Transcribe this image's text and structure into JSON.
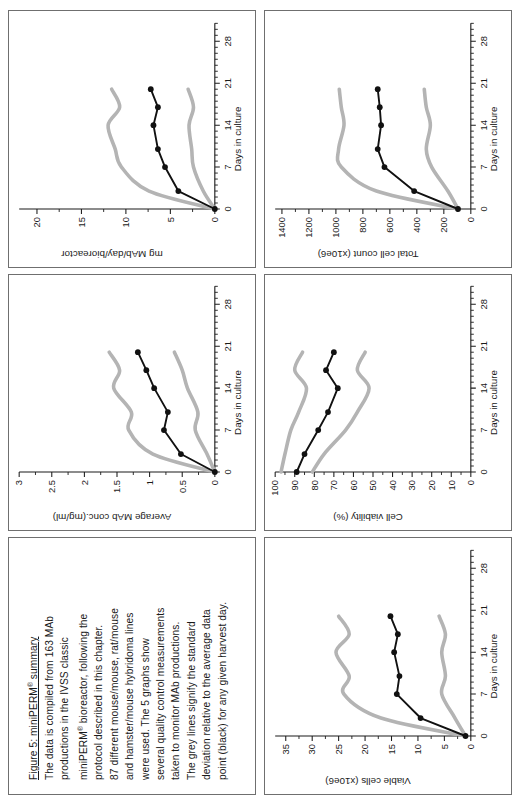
{
  "figure": {
    "caption_title": "Figure 5: miniPERM® summary",
    "caption_lines": [
      "The data is compiled from 163 MAb",
      "productions in the IVSS classic",
      "miniPERM®  bioreactor, following the",
      "protocol described in this chapter.",
      "87 different mouse/mouse, rat/mouse",
      "and hamster/mouse hybridoma lines",
      "were used. The 5 graphs show",
      "several quality control measurements",
      "taken to monitor MAb productions.",
      "The grey lines signify the standard",
      "deviation relative to the average data",
      "point (black) for any given harvest day."
    ],
    "colors": {
      "black_series": "#111111",
      "grey_band": "#b4b4b4",
      "axis": "#1a1a1a",
      "panel_border": "#6f6f6f",
      "background": "#ffffff"
    }
  },
  "chart_data": [
    {
      "id": "average-mab-conc",
      "type": "line",
      "title": "",
      "xlabel": "Days in culture",
      "ylabel": "Average MAb conc.(mg/ml)",
      "xlim": [
        0,
        31
      ],
      "ylim": [
        0,
        3
      ],
      "xticks": [
        0,
        7,
        14,
        21,
        28
      ],
      "xticklabels": [
        "0",
        "7",
        "14",
        "21",
        "28"
      ],
      "yticks": [
        0,
        0.5,
        1,
        1.5,
        2,
        2.5,
        3
      ],
      "yticklabels": [
        "0",
        "0.5",
        "1",
        "1.5",
        "2",
        "2.5",
        "3"
      ],
      "grid": false,
      "legend": null,
      "series": [
        {
          "name": "Average (black)",
          "color": "#111111",
          "marker": "filled-circle",
          "x": [
            0,
            3,
            7,
            10,
            14,
            17,
            20
          ],
          "y": [
            0.0,
            0.52,
            0.78,
            0.72,
            0.93,
            1.05,
            1.18
          ]
        },
        {
          "name": "Average + SD (grey)",
          "color": "#b4b4b4",
          "marker": "none",
          "x": [
            0,
            3,
            7,
            10,
            14,
            17,
            20
          ],
          "y": [
            0.0,
            0.95,
            1.32,
            1.28,
            1.55,
            1.46,
            1.62
          ]
        },
        {
          "name": "Average - SD (grey)",
          "color": "#b4b4b4",
          "marker": "none",
          "x": [
            0,
            3,
            7,
            10,
            14,
            17,
            20
          ],
          "y": [
            0.0,
            0.12,
            0.3,
            0.26,
            0.42,
            0.5,
            0.62
          ]
        }
      ]
    },
    {
      "id": "mg-mab-per-day",
      "type": "line",
      "title": "",
      "xlabel": "Days in culture",
      "ylabel": "mg MAb/day/bioreactor",
      "xlim": [
        0,
        31
      ],
      "ylim": [
        0,
        22
      ],
      "xticks": [
        0,
        7,
        14,
        21,
        28
      ],
      "xticklabels": [
        "0",
        "7",
        "14",
        "21",
        "28"
      ],
      "yticks": [
        0,
        5,
        10,
        15,
        20
      ],
      "yticklabels": [
        "0",
        "5",
        "10",
        "15",
        "20"
      ],
      "grid": false,
      "legend": null,
      "series": [
        {
          "name": "Average (black)",
          "color": "#111111",
          "marker": "filled-circle",
          "x": [
            0,
            3,
            7,
            10,
            14,
            17,
            20
          ],
          "y": [
            0.0,
            4.1,
            5.6,
            6.4,
            6.9,
            6.4,
            7.2
          ]
        },
        {
          "name": "Average + SD (grey)",
          "color": "#b4b4b4",
          "marker": "none",
          "x": [
            0,
            3,
            7,
            10,
            14,
            17,
            20
          ],
          "y": [
            0.0,
            7.4,
            10.5,
            11.2,
            12.0,
            10.7,
            11.6
          ]
        },
        {
          "name": "Average - SD (grey)",
          "color": "#b4b4b4",
          "marker": "none",
          "x": [
            0,
            3,
            7,
            10,
            14,
            17,
            20
          ],
          "y": [
            0.0,
            1.3,
            2.4,
            2.6,
            2.9,
            2.4,
            3.0
          ]
        }
      ]
    },
    {
      "id": "viable-cells",
      "type": "line",
      "title": "",
      "xlabel": "Days in culture",
      "ylabel": "Viable cells (x10e6)",
      "xlim": [
        0,
        31
      ],
      "ylim": [
        0,
        37
      ],
      "xticks": [
        0,
        7,
        14,
        21,
        28
      ],
      "xticklabels": [
        "0",
        "7",
        "14",
        "21",
        "28"
      ],
      "yticks": [
        0,
        5,
        10,
        15,
        20,
        25,
        30,
        35
      ],
      "yticklabels": [
        "0",
        "5",
        "10",
        "15",
        "20",
        "25",
        "30",
        "35"
      ],
      "grid": false,
      "legend": null,
      "series": [
        {
          "name": "Average (black)",
          "color": "#111111",
          "marker": "filled-circle",
          "x": [
            0,
            3,
            7,
            10,
            14,
            17,
            20
          ],
          "y": [
            1.0,
            9.5,
            14.0,
            13.5,
            14.5,
            13.8,
            15.2
          ]
        },
        {
          "name": "Average + SD (grey)",
          "color": "#b4b4b4",
          "marker": "none",
          "x": [
            0,
            3,
            7,
            10,
            14,
            17,
            20
          ],
          "y": [
            1.0,
            17.0,
            24.0,
            23.0,
            25.5,
            23.0,
            25.0
          ]
        },
        {
          "name": "Average - SD (grey)",
          "color": "#b4b4b4",
          "marker": "none",
          "x": [
            0,
            3,
            7,
            10,
            14,
            17,
            20
          ],
          "y": [
            1.0,
            3.0,
            5.5,
            4.8,
            5.5,
            4.8,
            6.0
          ]
        }
      ]
    },
    {
      "id": "cell-viability",
      "type": "line",
      "title": "",
      "xlabel": "Days in culture",
      "ylabel": "Cell viability (%)",
      "xlim": [
        0,
        31
      ],
      "ylim": [
        0,
        100
      ],
      "xticks": [
        0,
        7,
        14,
        21,
        28
      ],
      "xticklabels": [
        "0",
        "7",
        "14",
        "21",
        "28"
      ],
      "yticks": [
        0,
        10,
        20,
        30,
        40,
        50,
        60,
        70,
        80,
        90,
        100
      ],
      "yticklabels": [
        "0",
        "10",
        "20",
        "30",
        "40",
        "50",
        "60",
        "70",
        "80",
        "90",
        "100"
      ],
      "grid": false,
      "legend": null,
      "series": [
        {
          "name": "Average (black)",
          "color": "#111111",
          "marker": "filled-circle",
          "x": [
            0,
            3,
            7,
            10,
            14,
            17,
            20
          ],
          "y": [
            89,
            85,
            78,
            73,
            68,
            74,
            70
          ]
        },
        {
          "name": "Average + SD (grey)",
          "color": "#b4b4b4",
          "marker": "none",
          "x": [
            0,
            3,
            7,
            10,
            14,
            17,
            20
          ],
          "y": [
            97,
            95,
            92,
            88,
            84,
            90,
            86
          ]
        },
        {
          "name": "Average - SD (grey)",
          "color": "#b4b4b4",
          "marker": "none",
          "x": [
            0,
            3,
            7,
            10,
            14,
            17,
            20
          ],
          "y": [
            81,
            75,
            64,
            58,
            52,
            58,
            54
          ]
        }
      ]
    },
    {
      "id": "total-cell-count",
      "type": "line",
      "title": "",
      "xlabel": "Days in culture",
      "ylabel": "Total cell count (x10e6)",
      "xlim": [
        0,
        31
      ],
      "ylim": [
        0,
        1450
      ],
      "xticks": [
        0,
        7,
        14,
        21,
        28
      ],
      "xticklabels": [
        "0",
        "7",
        "14",
        "21",
        "28"
      ],
      "yticks": [
        0,
        200,
        400,
        600,
        800,
        1000,
        1200,
        1400
      ],
      "yticklabels": [
        "0",
        "200",
        "400",
        "600",
        "800",
        "1000",
        "1200",
        "1400"
      ],
      "grid": false,
      "legend": null,
      "series": [
        {
          "name": "Average (black)",
          "color": "#111111",
          "marker": "filled-circle",
          "x": [
            0,
            3,
            7,
            10,
            14,
            17,
            20
          ],
          "y": [
            95,
            420,
            640,
            690,
            665,
            675,
            690
          ]
        },
        {
          "name": "Average + SD (grey)",
          "color": "#b4b4b4",
          "marker": "none",
          "x": [
            0,
            3,
            7,
            10,
            14,
            17,
            20
          ],
          "y": [
            95,
            700,
            960,
            980,
            940,
            960,
            975
          ]
        },
        {
          "name": "Average - SD (grey)",
          "color": "#b4b4b4",
          "marker": "none",
          "x": [
            0,
            3,
            7,
            10,
            14,
            17,
            20
          ],
          "y": [
            95,
            170,
            290,
            330,
            300,
            330,
            345
          ]
        }
      ]
    }
  ],
  "panels": {
    "order": [
      "caption",
      "average-mab-conc",
      "mg-mab-per-day",
      "viable-cells",
      "cell-viability",
      "total-cell-count"
    ]
  }
}
